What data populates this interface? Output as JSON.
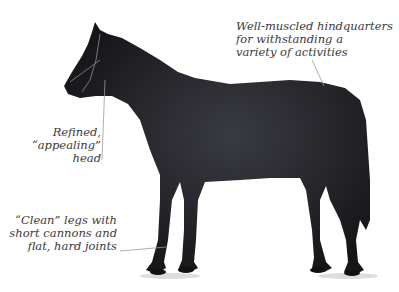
{
  "figure": {
    "annotations": [
      {
        "id": "hindquarters",
        "lines": [
          "Well-muscled hindquarters",
          "for withstanding a",
          "variety of activities"
        ]
      },
      {
        "id": "head",
        "lines": [
          "Refined,",
          "“appealing”",
          "head"
        ]
      },
      {
        "id": "legs",
        "lines": [
          "“Clean” legs with",
          "short cannons and",
          "flat, hard joints"
        ]
      }
    ]
  },
  "colors": {
    "background": "#ffffff",
    "horse": "#1e1e22",
    "text": "#3a3a3a",
    "leader": "#9a9a9a"
  }
}
